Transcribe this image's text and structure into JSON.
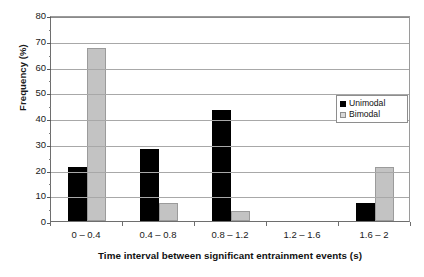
{
  "chart_data": {
    "type": "bar",
    "title": "",
    "xlabel": "Time interval between significant entrainment events (s)",
    "ylabel": "Frequency (%)",
    "categories": [
      "0 – 0.4",
      "0.4 – 0.8",
      "0.8 – 1.2",
      "1.2 – 1.6",
      "1.6 – 2"
    ],
    "series": [
      {
        "name": "Unimodal",
        "color": "#000000",
        "values": [
          21,
          28,
          43,
          0,
          7
        ]
      },
      {
        "name": "Bimodal",
        "color": "#c3c3c3",
        "values": [
          67,
          7,
          4,
          0,
          21
        ]
      }
    ],
    "ylim": [
      0,
      80
    ],
    "ytick_step": 10,
    "yticks": [
      0,
      10,
      20,
      30,
      40,
      50,
      60,
      70,
      80
    ],
    "ytick_labels": [
      "0",
      "10",
      "20",
      "30",
      "40",
      "50",
      "60",
      "70",
      "80"
    ],
    "yminor_step": 5,
    "grid": "horizontal",
    "legend_position": "inside-right"
  },
  "legend": {
    "entries": [
      {
        "label": "Unimodal",
        "swatch": "unimodal"
      },
      {
        "label": "Bimodal",
        "swatch": "bimodal"
      }
    ]
  }
}
